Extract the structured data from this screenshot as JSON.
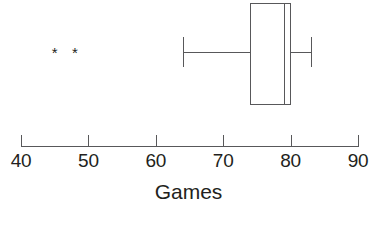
{
  "chart_data": {
    "type": "box",
    "title": "",
    "xlabel": "Games",
    "ylabel": "",
    "xlim": [
      40,
      90
    ],
    "grid": false,
    "legend": null,
    "orientation": "horizontal",
    "xticks": [
      40,
      50,
      60,
      70,
      80,
      90
    ],
    "xtick_labels": [
      "40",
      "50",
      "60",
      "70",
      "80",
      "90"
    ],
    "boxes": [
      {
        "name": "Games",
        "whisker_low": 64,
        "q1": 74,
        "median": 79,
        "q3": 80,
        "whisker_high": 83,
        "outliers": [
          45,
          48
        ]
      }
    ],
    "outlier_marker": "*"
  },
  "axis": {
    "title": "Games",
    "ticks": [
      {
        "value": 40,
        "label": "40"
      },
      {
        "value": 50,
        "label": "50"
      },
      {
        "value": 60,
        "label": "60"
      },
      {
        "value": 70,
        "label": "70"
      },
      {
        "value": 80,
        "label": "80"
      },
      {
        "value": 90,
        "label": "90"
      }
    ]
  },
  "style": {
    "line_color": "#58585a",
    "text_color": "#231f20",
    "background": "#ffffff"
  }
}
